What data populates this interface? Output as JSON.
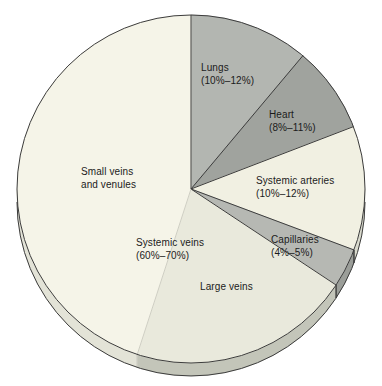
{
  "chart_data": {
    "type": "pie",
    "title": "",
    "start_angle_deg": 0,
    "direction": "clockwise",
    "outline_color": "#3c3c3c",
    "subtle_edge_color": "#c9c9be",
    "segments": [
      {
        "label": "Lungs",
        "percent_range": "10%–12%",
        "share_deg": 40,
        "share_percent": 11.1,
        "color": "#b3b6b1",
        "side_color": "#a8aba6",
        "edge_stroke": "dark"
      },
      {
        "label": "Heart",
        "percent_range": "8%–11%",
        "share_deg": 29,
        "share_percent": 8.1,
        "color": "#a0a39e",
        "side_color": "#949792",
        "edge_stroke": "dark"
      },
      {
        "label": "Systemic arteries",
        "percent_range": "10%–12%",
        "share_deg": 41.5,
        "share_percent": 11.5,
        "color": "#f1f0e2",
        "side_color": "#d9dacd",
        "edge_stroke": "dark"
      },
      {
        "label": "Capillaries",
        "percent_range": "4%–5%",
        "share_deg": 13,
        "share_percent": 3.6,
        "color": "#b6b8b3",
        "side_color": "#9b9e99",
        "edge_stroke": "dark"
      },
      {
        "label": "Large veins",
        "percent_range": "",
        "share_deg": 74.5,
        "share_percent": 20.7,
        "color": "#e9e9dc",
        "side_color": "#c3c5b9",
        "edge_stroke": "dark"
      },
      {
        "label": "Small veins and venules",
        "percent_range": "",
        "share_deg": 162,
        "share_percent": 45.0,
        "color": "#f5f4e8",
        "side_color": "#e3e3d7",
        "edge_stroke": "subtle"
      }
    ],
    "group_annotation": {
      "label": "Systemic veins",
      "percent_range": "60%–70%",
      "covers": [
        "Large veins",
        "Small veins and venules"
      ]
    }
  },
  "labels": {
    "lungs": {
      "line1": "Lungs",
      "line2": "(10%–12%)"
    },
    "heart": {
      "line1": "Heart",
      "line2": "(8%–11%)"
    },
    "systemic_arteries": {
      "line1": "Systemic arteries",
      "line2": "(10%–12%)"
    },
    "capillaries": {
      "line1": "Capillaries",
      "line2": "(4%–5%)"
    },
    "large_veins": {
      "line1": "Large veins"
    },
    "small_veins": {
      "line1": "Small veins",
      "line2": "and venules"
    },
    "systemic_veins": {
      "line1": "Systemic veins",
      "line2": "(60%–70%)"
    }
  }
}
